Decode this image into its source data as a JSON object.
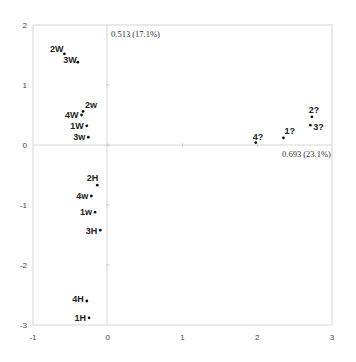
{
  "chart_data": {
    "type": "scatter",
    "title": "",
    "xlabel": "0.693 (23.1%)",
    "ylabel": "0.513 (17.1%)",
    "xlim": [
      -1,
      3
    ],
    "ylim": [
      -3,
      2
    ],
    "x_ticks": [
      "-1",
      "0",
      "1",
      "2",
      "3"
    ],
    "y_ticks": [
      "2",
      "1",
      "0",
      "-1",
      "-2",
      "-3"
    ],
    "grid": false,
    "reference_lines": {
      "x": 0,
      "y": 0
    },
    "points": [
      {
        "label": "2W",
        "x": -0.58,
        "y": 1.52
      },
      {
        "label": "3W",
        "x": -0.4,
        "y": 1.38
      },
      {
        "label": "2w",
        "x": -0.33,
        "y": 0.56
      },
      {
        "label": "4W",
        "x": -0.35,
        "y": 0.5
      },
      {
        "label": "1W",
        "x": -0.28,
        "y": 0.32
      },
      {
        "label": "3w",
        "x": -0.26,
        "y": 0.13
      },
      {
        "label": "2H",
        "x": -0.14,
        "y": -0.67
      },
      {
        "label": "4w",
        "x": -0.22,
        "y": -0.85
      },
      {
        "label": "1w",
        "x": -0.17,
        "y": -1.12
      },
      {
        "label": "3H",
        "x": -0.1,
        "y": -1.42
      },
      {
        "label": "4H",
        "x": -0.28,
        "y": -2.6
      },
      {
        "label": "1H",
        "x": -0.25,
        "y": -2.88
      },
      {
        "label": "4?",
        "x": 1.98,
        "y": 0.04
      },
      {
        "label": "1?",
        "x": 2.35,
        "y": 0.12
      },
      {
        "label": "2?",
        "x": 2.73,
        "y": 0.47
      },
      {
        "label": "3?",
        "x": 2.71,
        "y": 0.33
      }
    ]
  }
}
